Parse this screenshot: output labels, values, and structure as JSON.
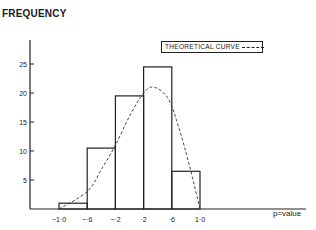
{
  "chart_data": {
    "type": "bar",
    "title": "",
    "ylabel": "FREQUENCY",
    "xlabel": "p=value",
    "legend": {
      "label": "THEORETICAL CURVE",
      "style": "dashed",
      "position": "upper-right"
    },
    "bin_edges": [
      -1.0,
      -0.6,
      -0.2,
      0.2,
      0.6,
      1.0
    ],
    "x_tick_labels": [
      "−1·0",
      "−·6",
      "−·2",
      "·2",
      "·6",
      "1·0"
    ],
    "y_ticks": [
      5,
      10,
      15,
      20,
      25
    ],
    "ylim": [
      0,
      30
    ],
    "grid": false,
    "categories": [
      "-1.0 to -0.6",
      "-0.6 to -0.2",
      "-0.2 to 0.2",
      "0.2 to 0.6",
      "0.6 to 1.0"
    ],
    "values": [
      1,
      10.5,
      19.5,
      24.5,
      6.5
    ],
    "series": [
      {
        "name": "Observed frequency",
        "type": "histogram",
        "values": [
          1,
          10.5,
          19.5,
          24.5,
          6.5
        ]
      },
      {
        "name": "THEORETICAL CURVE",
        "type": "line",
        "style": "dashed",
        "x": [
          -1.0,
          -0.6,
          -0.4,
          -0.2,
          0.0,
          0.2,
          0.35,
          0.55,
          0.7,
          0.85,
          1.0
        ],
        "y": [
          0,
          3,
          6.8,
          11,
          16,
          20,
          21,
          19,
          14,
          7.5,
          0
        ]
      }
    ]
  },
  "labels": {
    "ylabel": "FREQUENCY",
    "xlabel": "p=value",
    "legend": "THEORETICAL CURVE"
  }
}
